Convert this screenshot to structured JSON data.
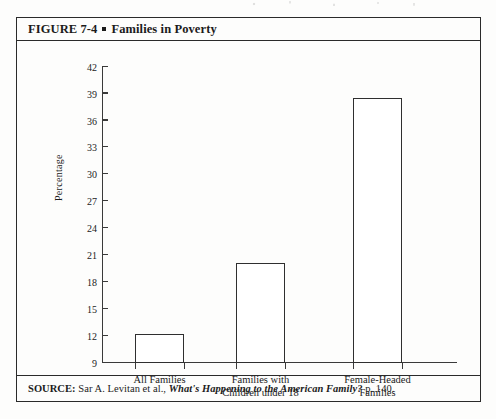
{
  "figure": {
    "title_prefix": "FIGURE 7-4",
    "title_text": "Families in Poverty",
    "source_label": "SOURCE:",
    "source_author": "Sar A. Levitan et al.,",
    "source_work": "What's Happening to the American Family?",
    "source_page": "p. 140."
  },
  "chart_data": {
    "type": "bar",
    "title": "Families in Poverty",
    "xlabel": "",
    "ylabel": "Percentage",
    "categories": [
      "All Families",
      "Families with Children under 18",
      "Female-Headed Families"
    ],
    "category_lines": [
      [
        "All Families"
      ],
      [
        "Families with",
        "Children under 18"
      ],
      [
        "Female-Headed",
        "Families"
      ]
    ],
    "values": [
      12.1,
      20.0,
      38.4
    ],
    "ylim": [
      9,
      42
    ],
    "ytick_step": 3,
    "yticks": [
      9,
      12,
      15,
      18,
      21,
      24,
      27,
      30,
      33,
      36,
      39,
      42
    ],
    "ytick_labels": [
      "9",
      "12",
      "15",
      "18",
      "21",
      "24",
      "27",
      "30",
      "33",
      "36",
      "39",
      "42"
    ],
    "grid": false,
    "legend": false,
    "bar_fill": "#ffffff",
    "bar_edge": "#2f2f2f",
    "axis_color": "#3a3a3a"
  }
}
